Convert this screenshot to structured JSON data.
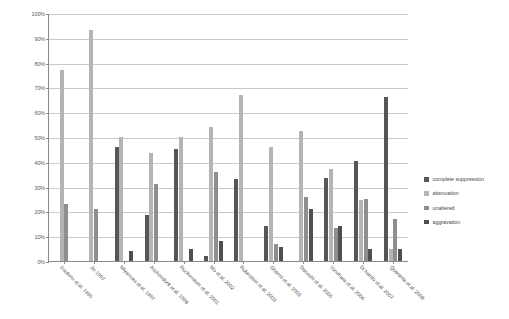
{
  "chart_data": {
    "type": "bar",
    "title": "",
    "xlabel": "",
    "ylabel": "",
    "ylim": [
      0,
      100
    ],
    "ytick_labels": [
      "0%",
      "10%",
      "20%",
      "30%",
      "40%",
      "50%",
      "60%",
      "70%",
      "80%",
      "90%",
      "100%"
    ],
    "ytick_values": [
      0,
      10,
      20,
      30,
      40,
      50,
      60,
      70,
      80,
      90,
      100
    ],
    "grid": true,
    "legend_position": "right",
    "categories": [
      "Soutiere et al. 1995",
      "Jin 1997",
      "Miyamoto et al. 1997",
      "Aschendorff et al. 1998",
      "Ruckenstein et al. 2001",
      "Mo et al. 2002",
      "Rubinstein et al. 2003",
      "Gharmi et al. 2003",
      "Daneshi et al. 2005",
      "Yonehara et al. 2006",
      "Di Nardo et al. 2007",
      "Quaranta et al. 2008"
    ],
    "series": [
      {
        "name": "complete suppression",
        "color": "#565656",
        "values": [
          0,
          0,
          46,
          18.5,
          45,
          2,
          33,
          14,
          0,
          33.5,
          40.5,
          66
        ]
      },
      {
        "name": "attenuation",
        "color": "#b4b4b4",
        "values": [
          77,
          93,
          50,
          43.5,
          50,
          54,
          67,
          46,
          52.5,
          37,
          24.5,
          5
        ]
      },
      {
        "name": "unaltered",
        "color": "#8e8e8e",
        "values": [
          23,
          21,
          0,
          31,
          0,
          36,
          0,
          7,
          26,
          13.5,
          25,
          17
        ]
      },
      {
        "name": "aggravation",
        "color": "#4f4f4f",
        "values": [
          0,
          0,
          4,
          0,
          5,
          8,
          0,
          5.5,
          21,
          14,
          5,
          5
        ]
      }
    ]
  },
  "legend": {
    "items": [
      {
        "label": "complete suppression",
        "color": "#565656"
      },
      {
        "label": "attenuation",
        "color": "#b4b4b4"
      },
      {
        "label": "unaltered",
        "color": "#8e8e8e"
      },
      {
        "label": "aggravation",
        "color": "#4f4f4f"
      }
    ]
  }
}
